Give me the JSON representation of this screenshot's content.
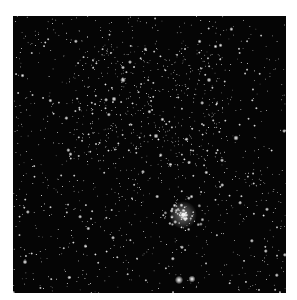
{
  "image": {
    "subject": "star field",
    "background": "#050505",
    "page_background": "#ffffff",
    "frame": {
      "left": 13,
      "top": 16,
      "width": 273,
      "height": 277
    },
    "features": {
      "cluster": {
        "cx": 170,
        "cy": 199,
        "radius": 14,
        "count": 70
      },
      "bright_stars": [
        {
          "x": 166,
          "y": 264,
          "r": 2.6
        },
        {
          "x": 179,
          "y": 263,
          "r": 2.2
        },
        {
          "x": 110,
          "y": 64,
          "r": 1.8
        },
        {
          "x": 101,
          "y": 83,
          "r": 1.6
        },
        {
          "x": 223,
          "y": 122,
          "r": 1.7
        },
        {
          "x": 143,
          "y": 120,
          "r": 1.6
        },
        {
          "x": 196,
          "y": 64,
          "r": 1.5
        },
        {
          "x": 12,
          "y": 246,
          "r": 1.5
        }
      ],
      "random_star_count": 1400,
      "seed": 42
    }
  }
}
